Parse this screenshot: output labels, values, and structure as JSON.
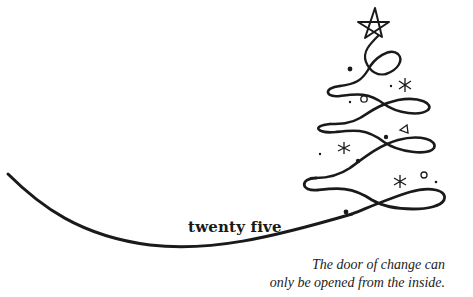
{
  "card": {
    "title": "twenty five",
    "quote": {
      "line1": "The door of change can",
      "line2": "only be opened from the inside."
    },
    "illustration": "christmas-tree-swirl",
    "ink_color": "#1a1a1a",
    "background": "#ffffff"
  }
}
